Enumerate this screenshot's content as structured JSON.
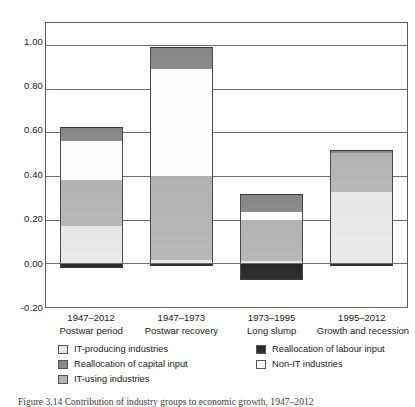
{
  "chart_data": {
    "type": "bar",
    "subtype": "stacked-bar",
    "title": "",
    "xlabel": "",
    "ylabel": "",
    "ylim": [
      -0.2,
      1.1
    ],
    "yticks": [
      "1.00",
      "0.80",
      "0.60",
      "0.40",
      "0.20",
      "0.00",
      "-0.20"
    ],
    "ytick_values": [
      1.0,
      0.8,
      0.6,
      0.4,
      0.2,
      0.0,
      -0.2
    ],
    "grid": true,
    "legend_position": "below",
    "categories": [
      {
        "period": "1947–2012",
        "name": "Postwar period"
      },
      {
        "period": "1947–1973",
        "name": "Postwar recovery"
      },
      {
        "period": "1973–1995",
        "name": "Long slump"
      },
      {
        "period": "1995–2012",
        "name": "Growth and recession"
      }
    ],
    "series": [
      {
        "name": "IT-producing industries",
        "values": [
          0.17,
          0.015,
          0.01,
          0.325
        ]
      },
      {
        "name": "IT-using industries",
        "values": [
          0.21,
          0.385,
          0.19,
          0.18
        ]
      },
      {
        "name": "Non-IT industries",
        "values": [
          0.18,
          0.49,
          0.035,
          0.0
        ]
      },
      {
        "name": "Reallocation of capital input",
        "values": [
          0.065,
          0.1,
          0.08,
          0.012
        ]
      },
      {
        "name": "Reallocation of labour input",
        "values": [
          -0.02,
          -0.012,
          -0.075,
          -0.012
        ]
      }
    ],
    "totals": [
      0.625,
      1.005,
      0.31,
      0.517
    ]
  },
  "legend": {
    "items": [
      {
        "label": "IT-producing industries",
        "swatch": "light-gray",
        "color": "#e9e9e9"
      },
      {
        "label": "Reallocation of labour input",
        "swatch": "black",
        "color": "#2b2b2b"
      },
      {
        "label": "Reallocation of capital input",
        "swatch": "dark-gray",
        "color": "#8a8a8a"
      },
      {
        "label": "Non-IT industries",
        "swatch": "white",
        "color": "#fdfdfd"
      },
      {
        "label": "IT-using industries",
        "swatch": "medium-gray",
        "color": "#b6b6b6"
      }
    ]
  },
  "caption": {
    "text": "Figure 3.14 Contribution of industry groups to economic growth, 1947–2012"
  }
}
